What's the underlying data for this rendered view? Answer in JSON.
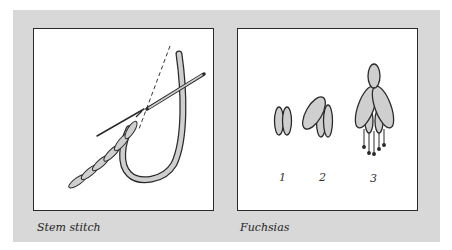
{
  "figures": [
    {
      "caption": "Stem stitch",
      "illustration": "stem-stitch-needle-and-thread"
    },
    {
      "caption": "Fuchsias",
      "illustration": "fuchsia-stitch-stages",
      "stages": [
        {
          "label": "1"
        },
        {
          "label": "2"
        },
        {
          "label": "3"
        }
      ]
    }
  ],
  "colors": {
    "panel": "#d8d8d8",
    "box_fill": "#ffffff",
    "outline": "#2a2a2a",
    "thread_fill": "#cfcfcf"
  }
}
